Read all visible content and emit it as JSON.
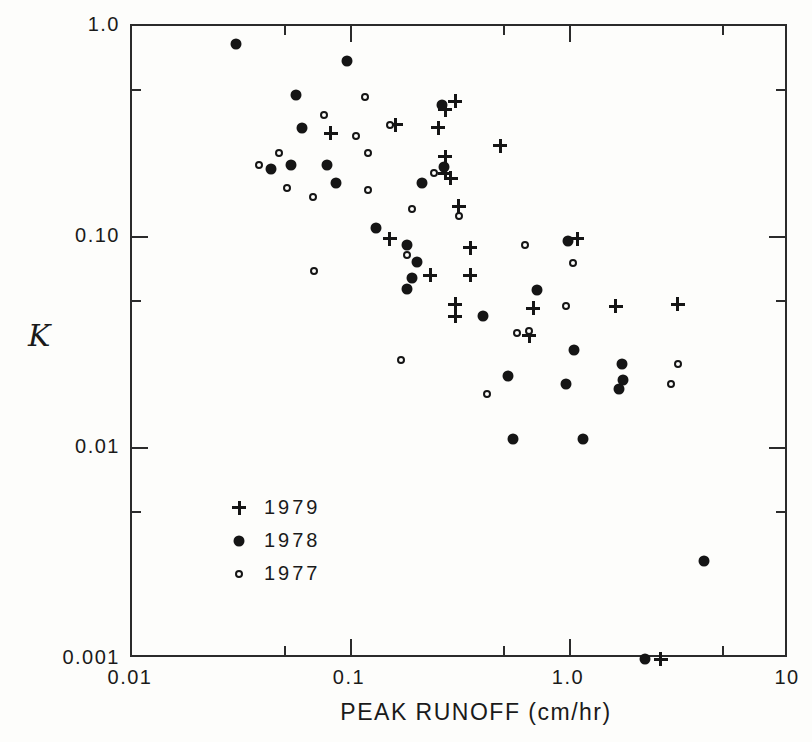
{
  "chart_data": {
    "type": "scatter",
    "title": "",
    "xlabel": "PEAK RUNOFF (cm/hr)",
    "ylabel": "K",
    "x_scale": "log",
    "y_scale": "log",
    "xlim": [
      0.01,
      10
    ],
    "ylim": [
      0.001,
      1.0
    ],
    "grid": false,
    "frame": true,
    "ink_color": "#151515",
    "x_ticks": {
      "major": [
        {
          "value": 0.01,
          "label": "0.01"
        },
        {
          "value": 0.1,
          "label": "0.1"
        },
        {
          "value": 1.0,
          "label": "1.0"
        },
        {
          "value": 10,
          "label": "10"
        }
      ],
      "minor": [
        0.05,
        0.5,
        5
      ]
    },
    "y_ticks": {
      "major": [
        {
          "value": 1.0,
          "label": "1.0"
        },
        {
          "value": 0.1,
          "label": "0.10"
        },
        {
          "value": 0.01,
          "label": "0.01"
        },
        {
          "value": 0.001,
          "label": "0.001"
        }
      ],
      "minor": [
        0.5,
        0.05,
        0.005
      ]
    },
    "legend": {
      "position": "inside-lower-left",
      "items": [
        {
          "label": "1979",
          "marker": "plus"
        },
        {
          "label": "1978",
          "marker": "filled-circle"
        },
        {
          "label": "1977",
          "marker": "open-circle"
        }
      ]
    },
    "series": [
      {
        "name": "1979",
        "marker": "plus",
        "points": [
          [
            0.081,
            0.31
          ],
          [
            0.15,
            0.098
          ],
          [
            0.16,
            0.34
          ],
          [
            0.23,
            0.066
          ],
          [
            0.25,
            0.33
          ],
          [
            0.27,
            0.4
          ],
          [
            0.27,
            0.24
          ],
          [
            0.27,
            0.2
          ],
          [
            0.285,
            0.19
          ],
          [
            0.3,
            0.44
          ],
          [
            0.3,
            0.048
          ],
          [
            0.3,
            0.042
          ],
          [
            0.31,
            0.14
          ],
          [
            0.35,
            0.089
          ],
          [
            0.35,
            0.066
          ],
          [
            0.48,
            0.27
          ],
          [
            0.65,
            0.034
          ],
          [
            0.68,
            0.046
          ],
          [
            1.08,
            0.098
          ],
          [
            1.62,
            0.047
          ],
          [
            2.6,
            0.001
          ],
          [
            3.1,
            0.048
          ]
        ]
      },
      {
        "name": "1978",
        "marker": "filled-circle",
        "points": [
          [
            0.03,
            0.82
          ],
          [
            0.043,
            0.21
          ],
          [
            0.053,
            0.22
          ],
          [
            0.056,
            0.47
          ],
          [
            0.06,
            0.33
          ],
          [
            0.078,
            0.22
          ],
          [
            0.085,
            0.18
          ],
          [
            0.096,
            0.68
          ],
          [
            0.13,
            0.11
          ],
          [
            0.18,
            0.092
          ],
          [
            0.18,
            0.057
          ],
          [
            0.19,
            0.064
          ],
          [
            0.2,
            0.076
          ],
          [
            0.21,
            0.18
          ],
          [
            0.26,
            0.42
          ],
          [
            0.265,
            0.215
          ],
          [
            0.4,
            0.042
          ],
          [
            0.52,
            0.022
          ],
          [
            0.55,
            0.011
          ],
          [
            0.71,
            0.056
          ],
          [
            0.96,
            0.02
          ],
          [
            0.98,
            0.096
          ],
          [
            1.04,
            0.029
          ],
          [
            1.15,
            0.011
          ],
          [
            1.68,
            0.019
          ],
          [
            1.73,
            0.025
          ],
          [
            1.75,
            0.021
          ],
          [
            2.2,
            0.001
          ],
          [
            4.1,
            0.0029
          ]
        ]
      },
      {
        "name": "1977",
        "marker": "open-circle",
        "points": [
          [
            0.038,
            0.22
          ],
          [
            0.047,
            0.25
          ],
          [
            0.051,
            0.17
          ],
          [
            0.067,
            0.155
          ],
          [
            0.068,
            0.069
          ],
          [
            0.075,
            0.38
          ],
          [
            0.105,
            0.3
          ],
          [
            0.116,
            0.46
          ],
          [
            0.12,
            0.25
          ],
          [
            0.12,
            0.167
          ],
          [
            0.15,
            0.34
          ],
          [
            0.17,
            0.026
          ],
          [
            0.18,
            0.082
          ],
          [
            0.19,
            0.135
          ],
          [
            0.24,
            0.2
          ],
          [
            0.31,
            0.126
          ],
          [
            0.42,
            0.018
          ],
          [
            0.57,
            0.035
          ],
          [
            0.62,
            0.092
          ],
          [
            0.65,
            0.036
          ],
          [
            0.96,
            0.047
          ],
          [
            1.03,
            0.075
          ],
          [
            2.9,
            0.02
          ],
          [
            3.1,
            0.025
          ]
        ]
      }
    ]
  }
}
